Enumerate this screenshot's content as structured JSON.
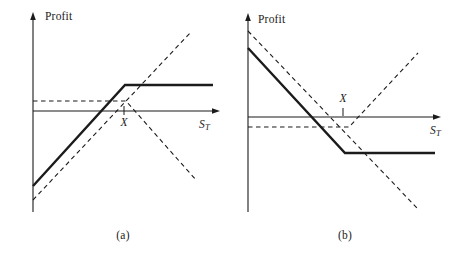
{
  "figure": {
    "background": "#ffffff",
    "line_color": "#1b1b1b",
    "panels": [
      {
        "id": "a",
        "caption": "(a)",
        "y_axis_label": "Profit",
        "x_axis_label": {
          "base": "S",
          "sub": "T"
        },
        "strike_label": "X",
        "geometry": {
          "v_axis": {
            "x": 33,
            "y_top": 12,
            "y_bottom": 212
          },
          "h_axis": {
            "y": 111,
            "x_left": 33,
            "x_right": 220
          },
          "x_tick": {
            "x": 124,
            "y1": 106,
            "y2": 115
          },
          "solid_line": [
            [
              33,
              186
            ],
            [
              125,
              85
            ],
            [
              213,
              85
            ]
          ],
          "dashed_lines": [
            [
              [
                33,
                200
              ],
              [
                190,
                33
              ]
            ],
            [
              [
                33,
                101
              ],
              [
                126,
                101
              ],
              [
                196,
                180
              ]
            ]
          ],
          "labels": {
            "y-axis": {
              "x": 45,
              "y": 11
            },
            "strike": {
              "x": 124,
              "y": 117
            },
            "x-axis": {
              "x": 199,
              "y": 119
            },
            "caption": {
              "x": 123,
              "y": 230
            }
          }
        }
      },
      {
        "id": "b",
        "caption": "(b)",
        "y_axis_label": "Profit",
        "x_axis_label": {
          "base": "S",
          "sub": "T"
        },
        "strike_label": "X",
        "geometry": {
          "v_axis": {
            "x": 248,
            "y_top": 13,
            "y_bottom": 212
          },
          "h_axis": {
            "y": 117,
            "x_left": 248,
            "x_right": 441
          },
          "x_tick": {
            "x": 343,
            "y1": 108,
            "y2": 116
          },
          "solid_line": [
            [
              248,
              48
            ],
            [
              345,
              153
            ],
            [
              435,
              153
            ]
          ],
          "dashed_lines": [
            [
              [
                248,
                31
              ],
              [
                417,
                208
              ]
            ],
            [
              [
                248,
                127
              ],
              [
                349,
                127
              ],
              [
                418,
                53
              ]
            ]
          ],
          "labels": {
            "y-axis": {
              "x": 258,
              "y": 14
            },
            "strike": {
              "x": 343,
              "y": 93
            },
            "x-axis": {
              "x": 430,
              "y": 125
            },
            "caption": {
              "x": 345,
              "y": 230
            }
          }
        }
      }
    ]
  },
  "chart_data": [
    {
      "type": "line",
      "title": "(a)",
      "xlabel": "S_T",
      "ylabel": "Profit",
      "x_ticks": [
        "X"
      ],
      "axis_numeric": false,
      "grid": false,
      "legend": "none",
      "x_unit": "multiples of strike X",
      "y_unit": "arbitrary (no scale shown)",
      "series": [
        {
          "name": "solid bold kinked line (rises then flat above zero after X)",
          "style": "solid-bold",
          "points": [
            [
              0,
              -0.84
            ],
            [
              1.0,
              0.3
            ],
            [
              1.98,
              0.3
            ]
          ]
        },
        {
          "name": "dashed rising straight line",
          "style": "dashed",
          "points": [
            [
              0,
              -0.99
            ],
            [
              1.73,
              0.87
            ]
          ]
        },
        {
          "name": "dashed line flat slightly above zero then falling after X",
          "style": "dashed",
          "points": [
            [
              0,
              0.11
            ],
            [
              1.02,
              0.11
            ],
            [
              1.79,
              -0.75
            ]
          ]
        }
      ]
    },
    {
      "type": "line",
      "title": "(b)",
      "xlabel": "S_T",
      "ylabel": "Profit",
      "x_ticks": [
        "X"
      ],
      "axis_numeric": false,
      "grid": false,
      "legend": "none",
      "x_unit": "multiples of strike X",
      "y_unit": "arbitrary (no scale shown)",
      "series": [
        {
          "name": "solid bold kinked line (falls then flat below zero after X)",
          "style": "solid-bold",
          "points": [
            [
              0,
              0.72
            ],
            [
              1.02,
              -0.37
            ],
            [
              1.97,
              -0.37
            ]
          ]
        },
        {
          "name": "dashed falling straight line",
          "style": "dashed",
          "points": [
            [
              0,
              0.89
            ],
            [
              1.78,
              -0.97
            ]
          ]
        },
        {
          "name": "dashed line flat slightly below zero then rising after X",
          "style": "dashed",
          "points": [
            [
              0,
              -0.12
            ],
            [
              1.06,
              -0.12
            ],
            [
              1.79,
              0.66
            ]
          ]
        }
      ]
    }
  ]
}
